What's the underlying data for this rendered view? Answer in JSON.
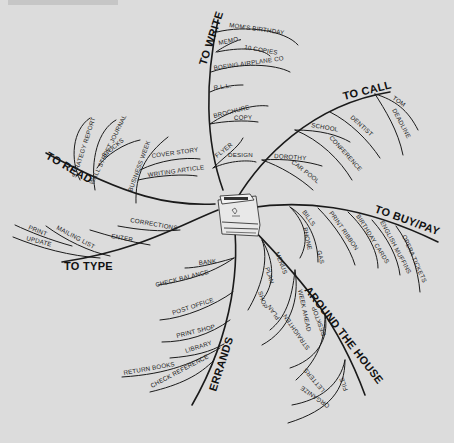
{
  "header": {
    "text": "... "
  },
  "center": {
    "icon": "notepad-icon"
  },
  "colors": {
    "background": "#dcdcdc",
    "ink": "#1a1a1a"
  },
  "branches": {
    "to_write": {
      "title": "TO WRITE",
      "items": [
        "MOM'S BIRTHDAY",
        "MEMO",
        "10 COPIES",
        "BOEING AIRPLANE CO",
        "R.L.L.",
        "BROCHURE",
        "COPY",
        "FLYER",
        "DESIGN"
      ]
    },
    "to_call": {
      "title": "TO CALL",
      "items": [
        "TOM",
        "DEADLINE",
        "DENTIST",
        "SCHOOL",
        "CONFERENCE",
        "DOROTHY",
        "CAR POOL"
      ]
    },
    "to_buy_pay": {
      "title": "TO BUY/PAY",
      "items": [
        "BILLS",
        "PHONE",
        "GAS",
        "PRINT RIBBON",
        "BIRTHDAY CARDS",
        "ENGLISH MUFFINS",
        "OPERA TICKETS"
      ]
    },
    "around_the_house": {
      "title": "AROUND THE HOUSE",
      "items": [
        "MENUS",
        "PLAN",
        "SHOP",
        "WEEK AHEAD",
        "PLAN",
        "DESKTOP",
        "STRAIGHTEN",
        "FILE",
        "LETTERS",
        "ORGANIZE"
      ]
    },
    "errands": {
      "title": "ERRANDS",
      "items": [
        "BANK",
        "CHECK BALANCE",
        "POST OFFICE",
        "PRINT SHOP",
        "LIBRARY",
        "RETURN BOOKS",
        "CHECK REFERENCE"
      ]
    },
    "to_type": {
      "title": "TO TYPE",
      "items": [
        "CORRECTIONS",
        "ENTER",
        "MAILING LIST",
        "PRINT",
        "UPDATE"
      ]
    },
    "to_read": {
      "title": "TO READ",
      "items": [
        "STRATEGY REPORT",
        "WALL STREET JOURNAL",
        "STOCKS",
        "BUSINESS WEEK",
        "COVER STORY",
        "WRITING ARTICLE"
      ]
    }
  }
}
